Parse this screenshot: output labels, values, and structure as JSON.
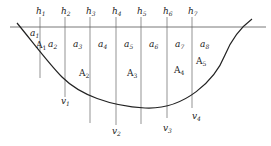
{
  "diagram": {
    "depth_labels": [
      {
        "id": "h1",
        "text": "h",
        "sub": "1",
        "x": 36
      },
      {
        "id": "h2",
        "text": "h",
        "sub": "2",
        "x": 61
      },
      {
        "id": "h3",
        "text": "h",
        "sub": "3",
        "x": 86
      },
      {
        "id": "h4",
        "text": "h",
        "sub": "4",
        "x": 112
      },
      {
        "id": "h5",
        "text": "h",
        "sub": "5",
        "x": 137
      },
      {
        "id": "h6",
        "text": "h",
        "sub": "6",
        "x": 163
      },
      {
        "id": "h7",
        "text": "h",
        "sub": "7",
        "x": 188
      }
    ],
    "width_labels": [
      {
        "id": "a1",
        "text": "a",
        "sub": "1",
        "x": 30,
        "y": 36
      },
      {
        "id": "a2",
        "text": "a",
        "sub": "2",
        "x": 48,
        "y": 47
      },
      {
        "id": "a3",
        "text": "a",
        "sub": "3",
        "x": 73,
        "y": 47
      },
      {
        "id": "a4",
        "text": "a",
        "sub": "4",
        "x": 98,
        "y": 47
      },
      {
        "id": "a5",
        "text": "a",
        "sub": "5",
        "x": 124,
        "y": 47
      },
      {
        "id": "a6",
        "text": "a",
        "sub": "6",
        "x": 149,
        "y": 47
      },
      {
        "id": "a7",
        "text": "a",
        "sub": "7",
        "x": 175,
        "y": 47
      },
      {
        "id": "a8",
        "text": "a",
        "sub": "8",
        "x": 200,
        "y": 47
      }
    ],
    "area_labels": [
      {
        "id": "A1",
        "text": "A",
        "sub": "1",
        "x": 36,
        "y": 48
      },
      {
        "id": "A2",
        "text": "A",
        "sub": "2",
        "x": 79,
        "y": 76
      },
      {
        "id": "A3",
        "text": "A",
        "sub": "3",
        "x": 127,
        "y": 76
      },
      {
        "id": "A4",
        "text": "A",
        "sub": "4",
        "x": 174,
        "y": 73
      },
      {
        "id": "A5",
        "text": "A",
        "sub": "5",
        "x": 196,
        "y": 64
      }
    ],
    "velocity_labels": [
      {
        "id": "v1",
        "text": "v",
        "sub": "1",
        "x": 61,
        "y": 104
      },
      {
        "id": "v2",
        "text": "v",
        "sub": "2",
        "x": 112,
        "y": 134
      },
      {
        "id": "v3",
        "text": "v",
        "sub": "3",
        "x": 163,
        "y": 131
      },
      {
        "id": "v4",
        "text": "v",
        "sub": "4",
        "x": 192,
        "y": 119
      }
    ],
    "verticals_x": [
      40,
      65,
      90,
      116,
      141,
      167,
      192
    ],
    "vertical_bottoms": [
      78,
      97,
      123,
      125,
      124,
      118,
      108
    ]
  }
}
